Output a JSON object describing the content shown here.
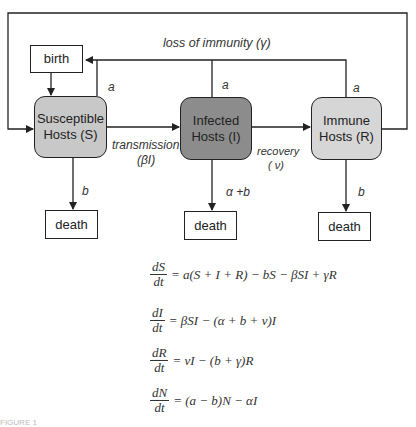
{
  "diagram": {
    "type": "SIR compartment model flow diagram",
    "colors": {
      "susceptible_fill": "#c8c8c8",
      "infected_fill": "#8c8c8c",
      "immune_fill": "#d6d6d6",
      "line": "#222222",
      "background": "#ffffff"
    },
    "nodes": {
      "birth": "birth",
      "susceptible_line1": "Susceptible",
      "susceptible_line2": "Hosts (S)",
      "infected_line1": "Infected",
      "infected_line2": "Hosts (I)",
      "immune_line1": "Immune",
      "immune_line2": "Hosts (R)",
      "death_s": "death",
      "death_i": "death",
      "death_r": "death"
    },
    "edges": {
      "loss_of_immunity": "loss of immunity (γ)",
      "birth_rate_s": "a",
      "birth_rate_i": "a",
      "birth_rate_r": "a",
      "transmission_line1": "transmission",
      "transmission_line2": "(βI)",
      "recovery_line1": "recovery",
      "recovery_line2": "( ν)",
      "death_rate_s": "b",
      "death_rate_i": "α +b",
      "death_rate_r": "b"
    }
  },
  "equations": [
    {
      "num": "dS",
      "den": "dt",
      "rhs": "= a(S + I + R) − bS − βSI + γR"
    },
    {
      "num": "dI",
      "den": "dt",
      "rhs": "= βSI − (α + b + ν)I"
    },
    {
      "num": "dR",
      "den": "dt",
      "rhs": "= νI − (b + γ)R"
    },
    {
      "num": "dN",
      "den": "dt",
      "rhs": "= (a − b)N − αI"
    }
  ],
  "caption": "FIGURE 1"
}
